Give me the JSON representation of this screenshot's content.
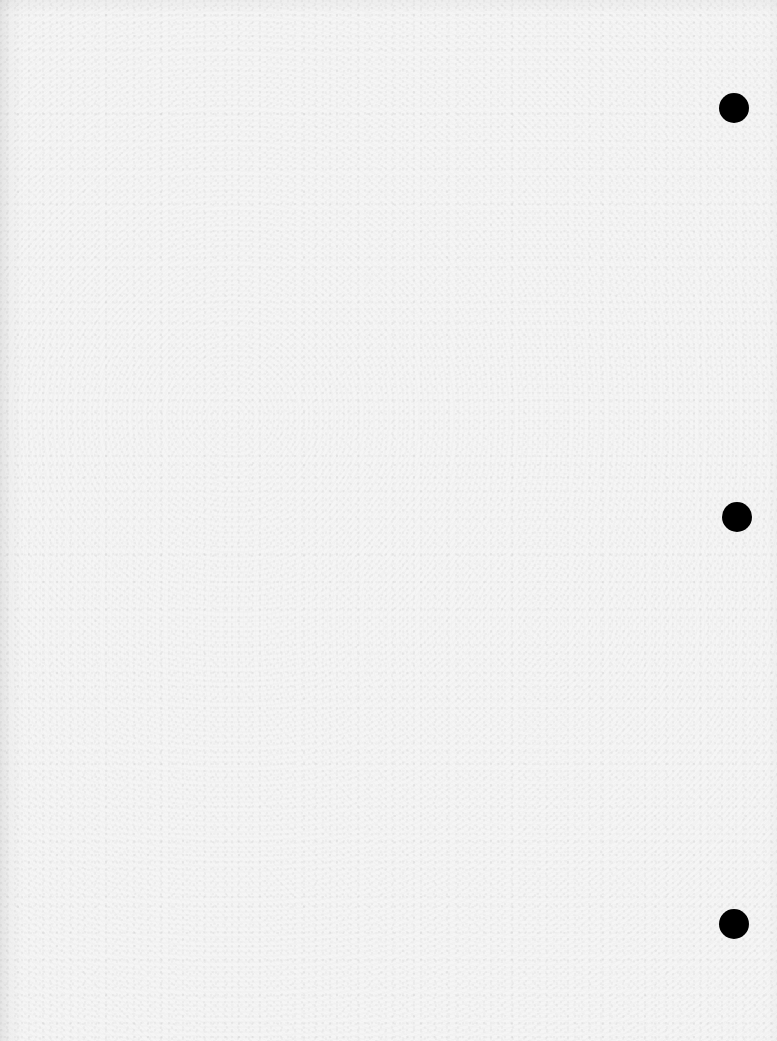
{
  "document": {
    "type": "blank three-hole-punched sheet",
    "text_content": "",
    "paper_color": "#f5f5f5",
    "punch_holes": [
      {
        "id": "top",
        "cx": 734,
        "cy": 108,
        "diameter": 30,
        "color": "#000000"
      },
      {
        "id": "middle",
        "cx": 737,
        "cy": 517,
        "diameter": 30,
        "color": "#000000"
      },
      {
        "id": "bottom",
        "cx": 734,
        "cy": 924,
        "diameter": 30,
        "color": "#000000"
      }
    ]
  }
}
